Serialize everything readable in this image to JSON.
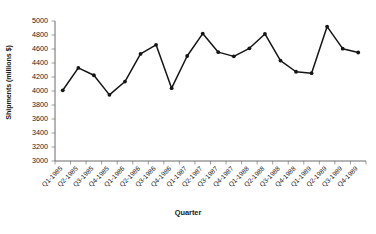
{
  "chart_data": {
    "type": "line",
    "title": "",
    "xlabel": "Quarter",
    "ylabel": "Shipments (millions $)",
    "categories": [
      "Q1-1985",
      "Q2-1985",
      "Q3-1985",
      "Q4-1985",
      "Q1-1986",
      "Q2-1986",
      "Q3-1986",
      "Q4-1986",
      "Q1-1987",
      "Q2-1987",
      "Q3-1987",
      "Q4-1987",
      "Q1-1988",
      "Q2-1988",
      "Q3-1988",
      "Q4-1988",
      "Q1-1989",
      "Q2-1989",
      "Q3-1989",
      "Q4-1989"
    ],
    "values": [
      4010,
      4330,
      4225,
      3945,
      4135,
      4530,
      4660,
      4040,
      4500,
      4820,
      4555,
      4495,
      4610,
      4815,
      4435,
      4275,
      4255,
      4920,
      4605,
      4550
    ],
    "ylim": [
      3000,
      5000
    ],
    "ytick_labels": [
      "5000",
      "4800",
      "4600",
      "4400",
      "4200",
      "4000",
      "3800",
      "3600",
      "3400",
      "3200",
      "3000"
    ],
    "ytick_values": [
      5000,
      4800,
      4600,
      4400,
      4200,
      4000,
      3800,
      3600,
      3400,
      3200,
      3000
    ],
    "grid": false,
    "legend": false,
    "legend_position": "none",
    "series_color": "#151515",
    "axis_color": "#5a5a5a",
    "marker": "circle",
    "background": "#ffffff"
  }
}
